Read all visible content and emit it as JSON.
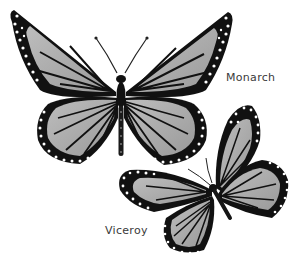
{
  "illustration": {
    "subject": "Monarch and Viceroy butterflies",
    "style": "grayscale ink illustration",
    "labels": {
      "monarch": "Monarch",
      "viceroy": "Viceroy"
    },
    "colors": {
      "background": "#ffffff",
      "outline": "#151515",
      "wing_fill": "#a8a8a8",
      "wing_light": "#c4c4c4",
      "spots": "#ffffff",
      "label_text": "#3a3a3a"
    }
  }
}
